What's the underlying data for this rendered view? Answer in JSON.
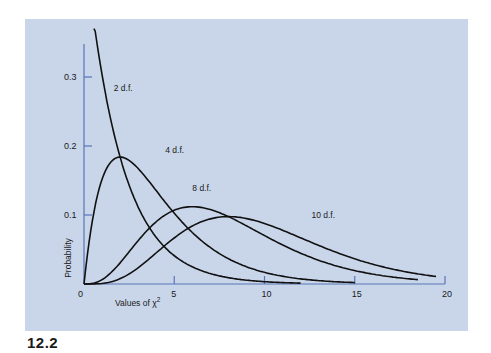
{
  "figure": {
    "label": "12.2"
  },
  "colors": {
    "panel_bg": "#c9d6ea",
    "axis": "#5a74b8",
    "curve": "#111111",
    "text": "#1a1a1a"
  },
  "chart_data": {
    "type": "line",
    "title": "",
    "xlabel": "Values of χ²",
    "ylabel": "Probability",
    "xlim": [
      0,
      20
    ],
    "ylim": [
      0,
      0.35
    ],
    "xticks": [
      0,
      5,
      10,
      15,
      20
    ],
    "yticks": [
      0.1,
      0.2,
      0.3
    ],
    "ytick_labels": [
      "0.1",
      "0.2",
      "0.3"
    ],
    "xtick_labels": [
      "0",
      "5",
      "10",
      "15",
      "20"
    ],
    "grid": false,
    "legend": "none (curves labeled inline)",
    "series": [
      {
        "name": "2 d.f.",
        "df": 2,
        "x_range": [
          0.55,
          12
        ],
        "peak": {
          "x": 0,
          "y": 0.5
        },
        "points": [
          [
            0.6,
            0.37
          ],
          [
            1,
            0.3
          ],
          [
            2,
            0.18
          ],
          [
            3,
            0.11
          ],
          [
            4,
            0.068
          ],
          [
            5,
            0.041
          ],
          [
            6,
            0.025
          ],
          [
            8,
            0.009
          ],
          [
            10,
            0.003
          ],
          [
            12,
            0.001
          ]
        ]
      },
      {
        "name": "4 d.f.",
        "df": 4,
        "x_range": [
          0,
          15
        ],
        "peak": {
          "x": 2,
          "y": 0.18
        },
        "points": [
          [
            0,
            0
          ],
          [
            1,
            0.15
          ],
          [
            2,
            0.18
          ],
          [
            3,
            0.17
          ],
          [
            4,
            0.135
          ],
          [
            5,
            0.1
          ],
          [
            6,
            0.075
          ],
          [
            8,
            0.037
          ],
          [
            10,
            0.017
          ],
          [
            12,
            0.007
          ],
          [
            15,
            0.002
          ]
        ]
      },
      {
        "name": "8 d.f.",
        "df": 8,
        "x_range": [
          0,
          18.5
        ],
        "peak": {
          "x": 6,
          "y": 0.105
        },
        "points": [
          [
            0,
            0
          ],
          [
            2,
            0.031
          ],
          [
            4,
            0.09
          ],
          [
            6,
            0.105
          ],
          [
            8,
            0.098
          ],
          [
            10,
            0.073
          ],
          [
            12,
            0.048
          ],
          [
            14,
            0.029
          ],
          [
            16,
            0.016
          ],
          [
            18.5,
            0.007
          ]
        ]
      },
      {
        "name": "10 d.f.",
        "df": 10,
        "x_range": [
          0,
          19.5
        ],
        "peak": {
          "x": 8,
          "y": 0.098
        },
        "points": [
          [
            0,
            0
          ],
          [
            2,
            0.008
          ],
          [
            4,
            0.036
          ],
          [
            6,
            0.075
          ],
          [
            8,
            0.098
          ],
          [
            10,
            0.088
          ],
          [
            12,
            0.067
          ],
          [
            14,
            0.046
          ],
          [
            16,
            0.03
          ],
          [
            18,
            0.018
          ],
          [
            19.5,
            0.012
          ]
        ]
      }
    ],
    "annotations": [
      {
        "text": "2 d.f.",
        "x": 1.65,
        "y": 0.28
      },
      {
        "text": "4 d.f.",
        "x": 4.5,
        "y": 0.19
      },
      {
        "text": "8 d.f.",
        "x": 6.0,
        "y": 0.135
      },
      {
        "text": "10 d.f.",
        "x": 12.6,
        "y": 0.095
      }
    ]
  }
}
